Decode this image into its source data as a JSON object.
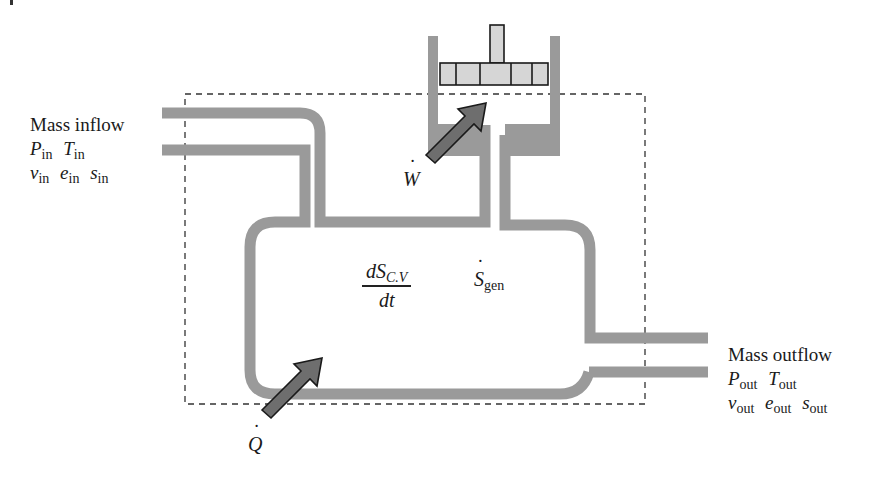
{
  "diagram": {
    "figure_type": "thermodynamic control volume",
    "colors": {
      "pipe": "#9a9a9a",
      "arrow": "#6e6e6e",
      "piston": "#d6d6d6",
      "outline": "#1a1a1a",
      "boundary": "#333333"
    },
    "inflow": {
      "title": "Mass inflow",
      "row1": [
        {
          "sym": "P",
          "sub": "in"
        },
        {
          "sym": "T",
          "sub": "in"
        }
      ],
      "row2": [
        {
          "sym": "v",
          "sub": "in"
        },
        {
          "sym": "e",
          "sub": "in"
        },
        {
          "sym": "s",
          "sub": "in"
        }
      ]
    },
    "outflow": {
      "title": "Mass outflow",
      "row1": [
        {
          "sym": "P",
          "sub": "out"
        },
        {
          "sym": "T",
          "sub": "out"
        }
      ],
      "row2": [
        {
          "sym": "v",
          "sub": "out"
        },
        {
          "sym": "e",
          "sub": "out"
        },
        {
          "sym": "s",
          "sub": "out"
        }
      ]
    },
    "entropy_rate": {
      "numerator": "dS",
      "numerator_sub": "C.V",
      "denominator": "dt"
    },
    "entropy_generation": {
      "sym": "S",
      "sub": "gen"
    },
    "work": {
      "sym": "W",
      "label": "work rate (W-dot)"
    },
    "heat": {
      "sym": "Q",
      "label": "heat rate (Q-dot)"
    }
  }
}
